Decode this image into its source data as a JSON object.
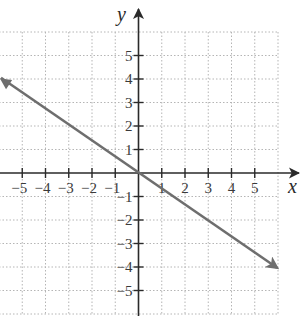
{
  "chart_data": {
    "type": "line",
    "title": "",
    "xlabel": "x",
    "ylabel": "y",
    "xlim": [
      -6,
      6
    ],
    "ylim": [
      -6,
      6
    ],
    "grid": true,
    "grid_style": "dotted",
    "x_ticks": [
      -5,
      -4,
      -3,
      -2,
      -1,
      1,
      2,
      3,
      4,
      5
    ],
    "y_ticks": [
      5,
      4,
      3,
      2,
      1,
      -1,
      -2,
      -3,
      -4,
      -5
    ],
    "x_tick_labels": [
      "−5",
      "−4",
      "−3",
      "−2",
      "−1",
      "1",
      "2",
      "3",
      "4",
      "5"
    ],
    "y_tick_labels": [
      "5",
      "4",
      "3",
      "2",
      "1",
      "−1",
      "−2",
      "−3",
      "−4",
      "−5"
    ],
    "series": [
      {
        "name": "line",
        "equation": "y = -2/3 x",
        "x": [
          -6,
          0,
          3,
          6
        ],
        "y": [
          4,
          0,
          -2,
          -4
        ],
        "arrows": "both",
        "color": "#6e6e6e"
      }
    ],
    "legend": null
  },
  "colors": {
    "axis": "#2a2a2a",
    "grid": "#b5b5b5",
    "line": "#6e6e6e"
  }
}
